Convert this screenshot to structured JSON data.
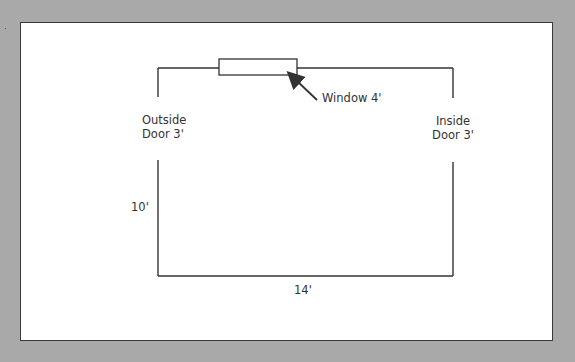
{
  "diagram": {
    "type": "floor-plan",
    "labels": {
      "window": "Window 4'",
      "outside_door_line1": "Outside",
      "outside_door_line2": "Door 3'",
      "inside_door_line1": "Inside",
      "inside_door_line2": "Door 3'",
      "side_dimension": "10'",
      "bottom_dimension": "14'"
    },
    "colors": {
      "background": "#a9a9a9",
      "panel": "#ffffff",
      "line": "#333333"
    }
  }
}
